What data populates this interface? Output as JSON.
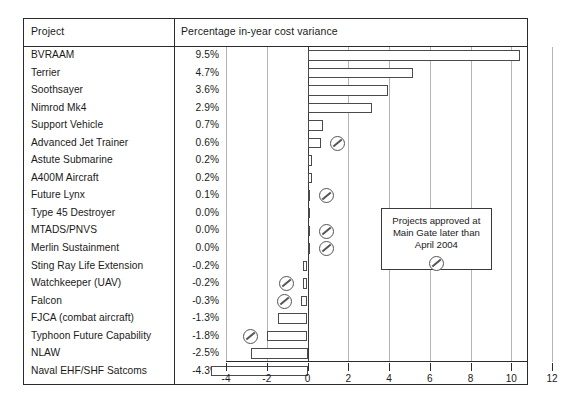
{
  "table": {
    "header": {
      "project_label": "Project",
      "chart_label": "Percentage in-year cost variance"
    }
  },
  "callout": {
    "line1": "Projects approved at",
    "line2": "Main Gate later than",
    "line3": "April 2004",
    "marker_icon": "no-entry-icon"
  },
  "chart_data": {
    "type": "bar",
    "orientation": "horizontal",
    "title": "Percentage in-year cost variance",
    "xlabel": "",
    "ylabel": "Project",
    "xlim": [
      -4,
      12
    ],
    "xticks": [
      -4,
      -2,
      0,
      2,
      4,
      6,
      8,
      10,
      12
    ],
    "xtick_labels": [
      "-4",
      "-2",
      "0",
      "2",
      "4",
      "6",
      "8",
      "10",
      "12"
    ],
    "grid": true,
    "legend_position": "inside-right",
    "categories": [
      "BVRAAM",
      "Terrier",
      "Soothsayer",
      "Nimrod Mk4",
      "Support Vehicle",
      "Advanced Jet Trainer",
      "Astute Submarine",
      "A400M Aircraft",
      "Future Lynx",
      "Type 45 Destroyer",
      "MTADS/PNVS",
      "Merlin Sustainment",
      "Sting Ray Life Extension",
      "Watchkeeper (UAV)",
      "Falcon",
      "FJCA (combat aircraft)",
      "Typhoon Future Capability",
      "NLAW",
      "Naval EHF/SHF Satcoms"
    ],
    "values": [
      9.5,
      4.7,
      3.6,
      2.9,
      0.7,
      0.6,
      0.2,
      0.2,
      0.1,
      0.0,
      0.0,
      0.0,
      -0.2,
      -0.2,
      -0.3,
      -1.3,
      -1.8,
      -2.5,
      -4.3
    ],
    "value_labels": [
      "9.5%",
      "4.7%",
      "3.6%",
      "2.9%",
      "0.7%",
      "0.6%",
      "0.2%",
      "0.2%",
      "0.1%",
      "0.0%",
      "0.0%",
      "0.0%",
      "-0.2%",
      "-0.2%",
      "-0.3%",
      "-1.3%",
      "-1.8%",
      "-2.5%",
      "-4.3%"
    ],
    "marked_categories": [
      "Advanced Jet Trainer",
      "Future Lynx",
      "MTADS/PNVS",
      "Merlin Sustainment",
      "Watchkeeper (UAV)",
      "Falcon",
      "Typhoon Future Capability"
    ],
    "marker_meaning": "Projects approved at Main Gate later than April 2004",
    "bar_face_color": "#ffffff",
    "bar_edge_color": "#4a4a4a",
    "grid_color": "#b4b4b4"
  }
}
